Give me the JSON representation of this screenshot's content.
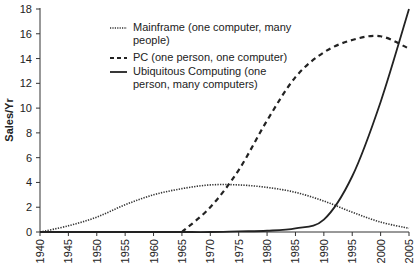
{
  "chart_data": {
    "type": "line",
    "title": "",
    "xlabel": "",
    "ylabel": "Sales/Yr",
    "xlim": [
      1940,
      2005
    ],
    "ylim": [
      0,
      18
    ],
    "grid": false,
    "legend_position": "upper-center",
    "x_ticks": [
      "1940",
      "1945",
      "1950",
      "1955",
      "1960",
      "1965",
      "1970",
      "1975",
      "1980",
      "1985",
      "1990",
      "1995",
      "2000",
      "2005"
    ],
    "y_ticks": [
      "0",
      "2",
      "4",
      "6",
      "8",
      "10",
      "12",
      "14",
      "16",
      "18"
    ],
    "x": [
      1940,
      1945,
      1950,
      1955,
      1960,
      1965,
      1970,
      1975,
      1980,
      1985,
      1990,
      1995,
      2000,
      2005
    ],
    "series": [
      {
        "name": "Mainframe (one computer, many people)",
        "style": "dotted",
        "values": [
          0.0,
          0.5,
          1.2,
          2.2,
          3.0,
          3.5,
          3.8,
          3.8,
          3.6,
          3.2,
          2.5,
          1.6,
          0.8,
          0.3
        ]
      },
      {
        "name": "PC (one person, one computer)",
        "style": "dashed",
        "values": [
          null,
          null,
          null,
          null,
          null,
          0.0,
          2.0,
          5.0,
          9.0,
          12.5,
          14.5,
          15.5,
          15.8,
          14.8
        ]
      },
      {
        "name": "Ubiquitous Computing (one person, many computers)",
        "style": "solid",
        "values": [
          0.0,
          0.0,
          0.0,
          0.0,
          0.0,
          0.0,
          0.0,
          0.05,
          0.1,
          0.3,
          1.0,
          4.5,
          10.5,
          18.0
        ]
      }
    ]
  },
  "legend": {
    "mainframe_line1": "Mainframe (one computer, many",
    "mainframe_line2": "people)",
    "pc": "PC (one person, one computer)",
    "uc_line1": "Ubiquitous Computing (one",
    "uc_line2": "person, many computers)"
  },
  "axis": {
    "ylabel": "Sales/Yr"
  }
}
